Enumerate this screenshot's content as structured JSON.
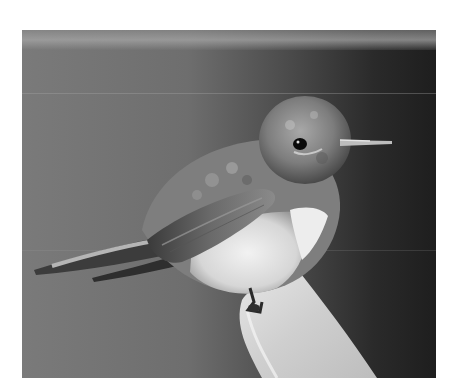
{
  "image": {
    "description": "Grayscale photograph of a hummingbird perched on the tip of a pale leaf against a dark gradient background",
    "subject": "hummingbird",
    "perch": "leaf tip",
    "colors": {
      "background_left": "#7a7a7a",
      "background_right": "#1e1e1e",
      "bird_body": "#8c8c8c",
      "bird_belly": "#e6e6e6",
      "leaf": "#d4d4d4",
      "eye": "#0a0a0a"
    }
  },
  "caption": {
    "text": ""
  }
}
